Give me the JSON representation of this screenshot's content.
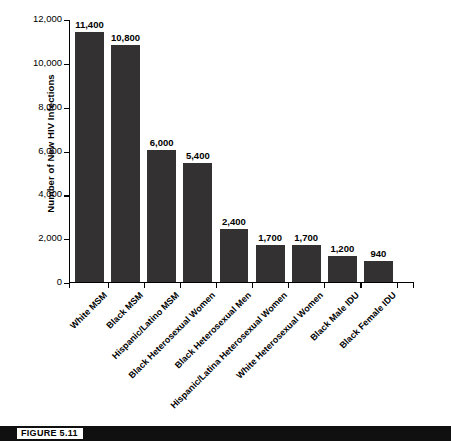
{
  "figure": {
    "tag": "FIGURE 5.11"
  },
  "chart_data": {
    "type": "bar",
    "title": "",
    "xlabel": "",
    "ylabel": "Number of New HIV Infections",
    "ylim": [
      0,
      12000
    ],
    "yticks": [
      "0",
      "2,000",
      "4,000",
      "6,000",
      "8,000",
      "10,000",
      "12,000"
    ],
    "ytick_values": [
      0,
      2000,
      4000,
      6000,
      8000,
      10000,
      12000
    ],
    "grid": false,
    "legend": "none",
    "bar_color": "#333132",
    "categories": [
      "White MSM",
      "Black MSM",
      "Hispanic/Latino MSM",
      "Black Heterosexual Women",
      "Black Heterosexual Men",
      "Hispanic/Latina Heterosexual Women",
      "White Heterosexual Women",
      "Black Male IDU",
      "Black Female IDU"
    ],
    "values": [
      11400,
      10800,
      6000,
      5400,
      2400,
      1700,
      1700,
      1200,
      940
    ],
    "value_labels": [
      "11,400",
      "10,800",
      "6,000",
      "5,400",
      "2,400",
      "1,700",
      "1,700",
      "1,200",
      "940"
    ]
  }
}
